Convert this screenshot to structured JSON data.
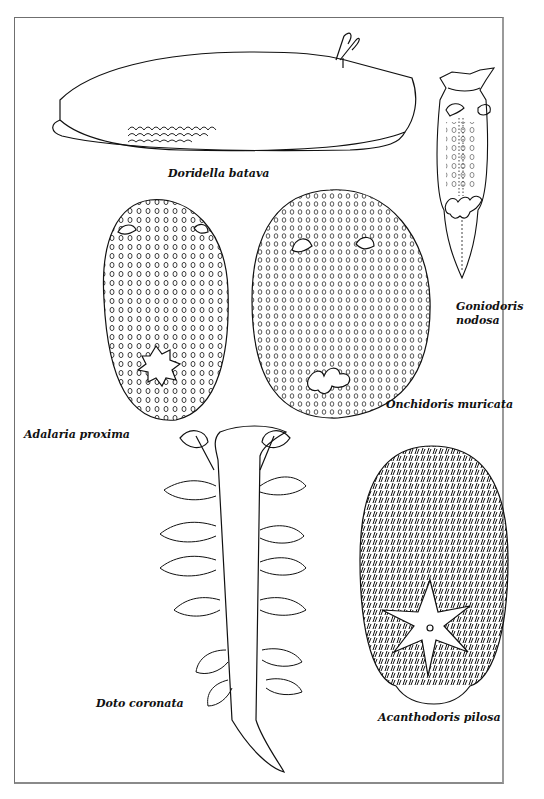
{
  "plate": {
    "border_color": "#6f6f6f",
    "ink_color": "#111111"
  },
  "specimens": [
    {
      "id": "doridella-batava",
      "label": "Doridella batava"
    },
    {
      "id": "goniodoris-nodosa",
      "label_line1": "Goniodoris",
      "label_line2": "nodosa"
    },
    {
      "id": "adalaria-proxima",
      "label": "Adalaria proxima"
    },
    {
      "id": "onchidoris-muricata",
      "label": "Onchidoris muricata"
    },
    {
      "id": "doto-coronata",
      "label": "Doto coronata"
    },
    {
      "id": "acanthodoris-pilosa",
      "label": "Acanthodoris pilosa"
    }
  ]
}
